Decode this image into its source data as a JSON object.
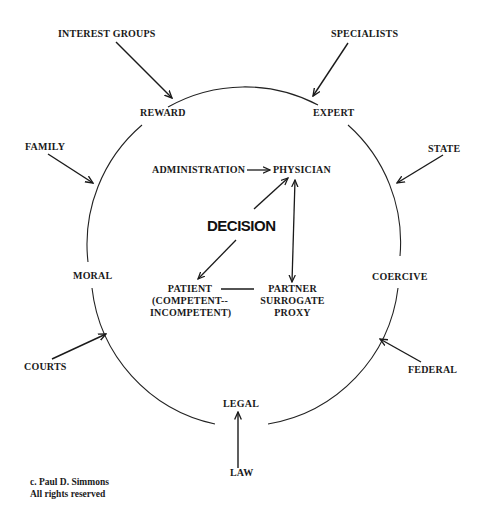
{
  "diagram": {
    "ring_labels": {
      "reward": "REWARD",
      "expert": "EXPERT",
      "moral": "MORAL",
      "coercive": "COERCIVE",
      "legal": "LEGAL"
    },
    "external_influences": {
      "interest_groups": "INTEREST GROUPS",
      "specialists": "SPECIALISTS",
      "family": "FAMILY",
      "state": "STATE",
      "courts": "COURTS",
      "federal": "FEDERAL",
      "law": "LAW"
    },
    "center": {
      "decision": "DECISION",
      "administration": "ADMINISTRATION",
      "physician": "PHYSICIAN",
      "patient_line1": "PATIENT",
      "patient_line2": "(COMPETENT--",
      "patient_line3": "INCOMPETENT)",
      "partner_line1": "PARTNER",
      "partner_line2": "SURROGATE",
      "partner_line3": "PROXY"
    },
    "copyright": {
      "line1": "c. Paul D. Simmons",
      "line2": "All rights reserved"
    },
    "colors": {
      "ink": "#1a1a1a",
      "background": "#ffffff"
    }
  }
}
